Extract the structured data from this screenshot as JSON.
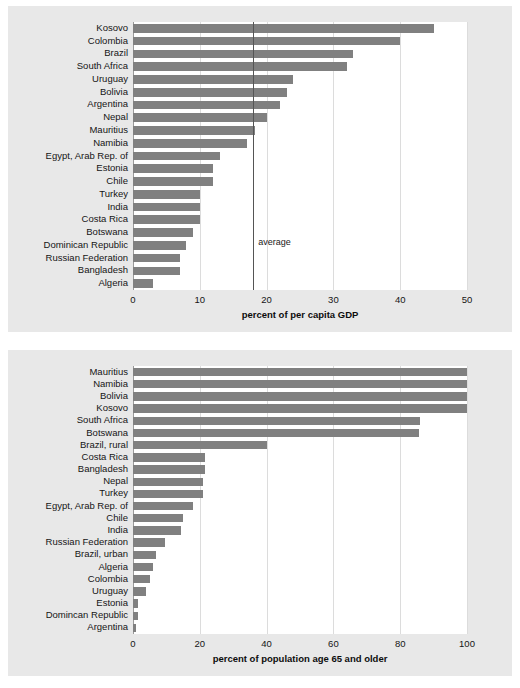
{
  "figure": {
    "cropped_header": "",
    "bar_color": "#808080",
    "panel_background": "#e8e8e8",
    "plot_background": "#ffffff",
    "gridline_color": "#dcdcdc",
    "average_line_color": "#555555"
  },
  "chart_data": [
    {
      "type": "bar",
      "orientation": "horizontal",
      "panel": "top",
      "title": "",
      "xlabel": "percent of per capita GDP",
      "ylabel": "",
      "xlim": [
        0,
        50
      ],
      "xticks": [
        0,
        10,
        20,
        30,
        40,
        50
      ],
      "grid": true,
      "legend": "none",
      "annotations": [
        {
          "label": "average",
          "value": 18,
          "type": "vertical-line"
        }
      ],
      "categories": [
        "Kosovo",
        "Colombia",
        "Brazil",
        "South Africa",
        "Uruguay",
        "Bolivia",
        "Argentina",
        "Nepal",
        "Mauritius",
        "Namibia",
        "Egypt, Arab Rep. of",
        "Estonia",
        "Chile",
        "Turkey",
        "India",
        "Costa Rica",
        "Botswana",
        "Dominican Republic",
        "Russian Federation",
        "Bangladesh",
        "Algeria"
      ],
      "values": [
        45,
        40,
        33,
        32,
        24,
        23,
        22,
        20,
        18.2,
        17,
        13,
        12,
        12,
        10,
        10,
        10,
        9,
        8,
        7,
        7,
        3
      ]
    },
    {
      "type": "bar",
      "orientation": "horizontal",
      "panel": "bottom",
      "title": "",
      "xlabel": "percent of population age 65 and older",
      "ylabel": "",
      "xlim": [
        0,
        100
      ],
      "xticks": [
        0,
        20,
        40,
        60,
        80,
        100
      ],
      "grid": true,
      "legend": "none",
      "annotations": [],
      "categories": [
        "Mauritius",
        "Namibia",
        "Bolivia",
        "Kosovo",
        "South Africa",
        "Botswana",
        "Brazil, rural",
        "Costa Rica",
        "Bangladesh",
        "Nepal",
        "Turkey",
        "Egypt, Arab Rep. of",
        "Chile",
        "India",
        "Russian Federation",
        "Brazil, urban",
        "Algeria",
        "Colombia",
        "Uruguay",
        "Estonia",
        "Domincan Republic",
        "Argentina"
      ],
      "values": [
        100,
        100,
        100,
        100,
        86,
        85.5,
        40,
        21.5,
        21.5,
        21,
        21,
        18,
        15,
        14.5,
        9.5,
        7,
        6,
        5,
        4,
        1.5,
        1.5,
        1
      ]
    }
  ]
}
